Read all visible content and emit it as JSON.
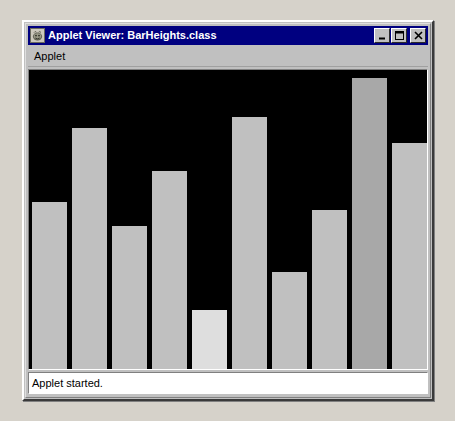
{
  "window": {
    "title": "Applet Viewer: BarHeights.class",
    "icon": "applet-viewer-icon",
    "buttons": {
      "minimize": "minimize-icon",
      "maximize": "maximize-icon",
      "close": "close-icon"
    }
  },
  "menubar": {
    "items": [
      {
        "label": "Applet"
      }
    ]
  },
  "statusbar": {
    "text": "Applet started."
  },
  "colors": {
    "titlebar": "#000080",
    "window_face": "#c0c0c0",
    "canvas_background": "#000000",
    "bar_fill": "#c0c0c0",
    "bar_fill_light": "#dedede",
    "bar_fill_dark": "#a8a8a8",
    "desktop": "#d6d2ca"
  },
  "chart_data": {
    "type": "bar",
    "title": "",
    "xlabel": "",
    "ylabel": "",
    "grid": false,
    "legend": false,
    "categories": [
      "1",
      "2",
      "3",
      "4",
      "5",
      "6",
      "7",
      "8",
      "9",
      "10"
    ],
    "values": [
      162,
      234,
      139,
      192,
      57,
      244,
      94,
      154,
      282,
      219
    ],
    "ylim": [
      0,
      290
    ],
    "bar_colors": [
      "#c0c0c0",
      "#c0c0c0",
      "#c0c0c0",
      "#c0c0c0",
      "#dedede",
      "#c0c0c0",
      "#c0c0c0",
      "#c0c0c0",
      "#a8a8a8",
      "#c0c0c0"
    ],
    "bar_width_px": 35,
    "bar_gap_px": 5,
    "canvas_height_px": 290,
    "canvas_width_px": 399
  }
}
